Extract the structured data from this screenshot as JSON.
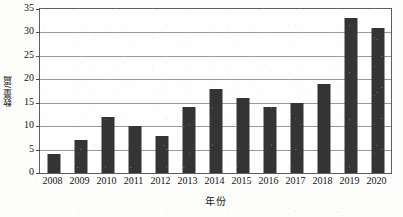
{
  "chart_data": {
    "type": "bar",
    "title": "",
    "subtitle": "",
    "xlabel": "年份",
    "ylabel": "数量/篇",
    "categories": [
      "2008",
      "2009",
      "2010",
      "2011",
      "2012",
      "2013",
      "2014",
      "2015",
      "2016",
      "2017",
      "2018",
      "2019",
      "2020"
    ],
    "values": [
      4,
      7,
      12,
      10,
      8,
      14,
      18,
      16,
      14,
      15,
      19,
      33,
      31
    ],
    "series": [
      {
        "name": "数量/篇",
        "values": [
          4,
          7,
          12,
          10,
          8,
          14,
          18,
          16,
          14,
          15,
          19,
          33,
          31
        ]
      }
    ],
    "ylim": [
      0,
      35
    ],
    "ytick_values": [
      0,
      5,
      10,
      15,
      20,
      25,
      30,
      35
    ],
    "ytick_labels": [
      "0",
      "5",
      "10",
      "15",
      "20",
      "25",
      "30",
      "35"
    ],
    "grid": "horizontal",
    "legend": "none",
    "bar_color": "#343434",
    "gridline_color": "#9a9a9a",
    "axis_color": "#5d5d5d",
    "background_color": "#fdfdfc",
    "annotations": []
  }
}
